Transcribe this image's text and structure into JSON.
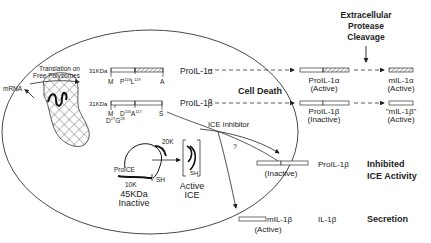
{
  "header": {
    "title_line1": "Extracellular",
    "title_line2": "Protease",
    "title_line3": "Cleavage"
  },
  "cell": {
    "translation_line1": "Translation on",
    "translation_line2": "Free Polysomes",
    "mrna_label": "mRNA",
    "cell_death_label": "Cell Death",
    "ice_inhibitor_label": "ICE Inhibitor",
    "question_mark": "?"
  },
  "proil1a": {
    "size_label": "31KDa",
    "site_m": "M",
    "site_p": "P",
    "site_p_sup": "118",
    "site_l": "L",
    "site_l_sup": "119",
    "site_a": "A",
    "name": "ProIL-1α"
  },
  "proil1b": {
    "size_label": "31KDa",
    "site_m": "M",
    "site_d": "D",
    "site_d_sup": "116",
    "site_a": "A",
    "site_a_sup": "117",
    "site_s": "S",
    "site_d2": "D",
    "site_d2_sup": "27",
    "site_g": "G",
    "site_g_sup": "28",
    "name": "ProIL-1β"
  },
  "proice": {
    "label": "ProICE",
    "k20": "20K",
    "k10": "10K",
    "sh": "SH",
    "size": "45KDa",
    "state": "Inactive"
  },
  "active_ice": {
    "sh": "SH",
    "line1": "Active",
    "line2": "ICE"
  },
  "outside": {
    "proil1a_name": "ProIL-1α",
    "proil1a_state": "(Active)",
    "mil1a_name": "mIL-1α",
    "mil1a_state": "(Active)",
    "proil1b_name": "ProIL-1β",
    "proil1b_state": "(Inactive)",
    "mil1b_q_name": "\"mIL-1β\"",
    "mil1b_q_state": "(Active)",
    "inhibited_state": "(Inactive)",
    "inhibited_name": "ProIL-1β",
    "inhibited_title1": "Inhibited",
    "inhibited_title2": "ICE Activity",
    "secreted_name": "mIL-1β",
    "secreted_state": "(Active)",
    "secreted_product": "IL-1β",
    "secretion_title": "Secretion"
  }
}
